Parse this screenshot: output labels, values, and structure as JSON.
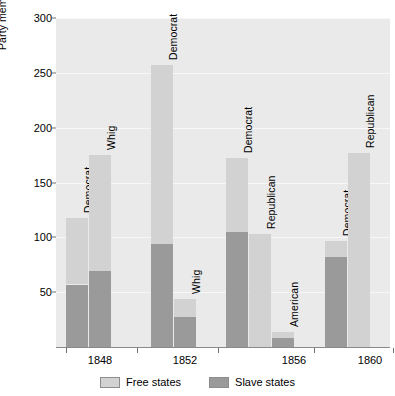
{
  "chart_data": {
    "type": "bar",
    "title": "",
    "subtitle": "",
    "xlabel": "",
    "ylabel": "Party members in House of Representatives",
    "ylim": [
      0,
      300
    ],
    "yticks": [
      50,
      100,
      150,
      200,
      250,
      300
    ],
    "grid": true,
    "stacked": true,
    "legend_position": "bottom",
    "categories": [
      "1848",
      "1852",
      "1856",
      "1860"
    ],
    "series": [
      {
        "name": "Free states",
        "color": "#d2d2d2"
      },
      {
        "name": "Slave states",
        "color": "#9a9a9a"
      }
    ],
    "bars": [
      {
        "year": "1848",
        "party": "Democrat",
        "total": 118,
        "slave_states": 57,
        "free_states": 61
      },
      {
        "year": "1848",
        "party": "Whig",
        "total": 175,
        "slave_states": 69,
        "free_states": 106
      },
      {
        "year": "1852",
        "party": "Democrat",
        "total": 257,
        "slave_states": 94,
        "free_states": 163
      },
      {
        "year": "1852",
        "party": "Whig",
        "total": 44,
        "slave_states": 27,
        "free_states": 17
      },
      {
        "year": "1856",
        "party": "Democrat",
        "total": 172,
        "slave_states": 105,
        "free_states": 67
      },
      {
        "year": "1856",
        "party": "Republican",
        "total": 103,
        "slave_states": 0,
        "free_states": 103
      },
      {
        "year": "1856",
        "party": "American",
        "total": 14,
        "slave_states": 8,
        "free_states": 6
      },
      {
        "year": "1860",
        "party": "Democrat",
        "total": 97,
        "slave_states": 82,
        "free_states": 15
      },
      {
        "year": "1860",
        "party": "Republican",
        "total": 177,
        "slave_states": 0,
        "free_states": 177
      }
    ]
  },
  "axis": {
    "y_title": "Party members in House of Representatives",
    "y_tick_labels": [
      "300",
      "250",
      "200",
      "150",
      "100",
      "50"
    ],
    "x_tick_labels": [
      "1848",
      "1852",
      "1856",
      "1860"
    ]
  },
  "legend": {
    "items": [
      {
        "label": "Free states",
        "color": "#d2d2d2"
      },
      {
        "label": "Slave states",
        "color": "#9a9a9a"
      }
    ]
  },
  "colors": {
    "plot_background": "#eaeaea",
    "gridline": "#f7f7f7",
    "free_states": "#d2d2d2",
    "slave_states": "#9a9a9a",
    "axis": "#8a8a8a",
    "text": "#000000"
  }
}
